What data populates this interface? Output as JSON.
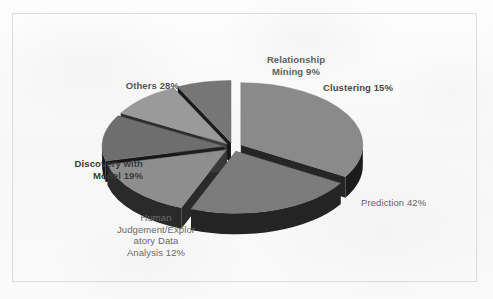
{
  "chart_data": {
    "type": "pie",
    "title": "",
    "style": "3d-exploded-pie",
    "grid": false,
    "legend": "none",
    "labels_position": "outside-callout",
    "total_percent": 125,
    "categories": [
      "Prediction",
      "Others",
      "Discovery with Model",
      "Clustering",
      "Human Judgement/Exploratory Data Analysis",
      "Relationship Mining"
    ],
    "values": [
      42,
      28,
      19,
      15,
      12,
      9
    ],
    "slices": [
      {
        "name": "prediction",
        "label_text": "Prediction 42%",
        "value": 42,
        "top_color": "#8a8a8a",
        "side_color": "#1c1c1c",
        "exploded": true
      },
      {
        "name": "others",
        "label_text": "Others 28%",
        "value": 28,
        "top_color": "#7c7c7c",
        "side_color": "#242424",
        "exploded": true
      },
      {
        "name": "discovery-with-model",
        "label_text": "Discovery with\nModel 19%",
        "value": 19,
        "top_color": "#8e8e8e",
        "side_color": "#2a2a2a",
        "exploded": true
      },
      {
        "name": "clustering",
        "label_text": "Clustering 15%",
        "value": 15,
        "top_color": "#6e6e6e",
        "side_color": "#161616",
        "exploded": true
      },
      {
        "name": "human-judgement",
        "label_text": "Human\nJudgement/Explor\natory Data\nAnalysis 12%",
        "value": 12,
        "top_color": "#9a9a9a",
        "side_color": "#2e2e2e",
        "exploded": true
      },
      {
        "name": "relationship-mining",
        "label_text": "Relationship\nMining 9%",
        "value": 9,
        "top_color": "#767676",
        "side_color": "#1a1a1a",
        "exploded": true
      }
    ],
    "label_colors": {
      "prediction": "#636363",
      "others": "#555555",
      "discovery_with_model": "#3a3a3a",
      "clustering": "#4a4a4a",
      "human_judgement": "#6a6a6a",
      "relationship_mining": "#5e5e5e"
    },
    "frame_border_color": "#dcdcdc",
    "background_color": "#fbfbfb"
  }
}
